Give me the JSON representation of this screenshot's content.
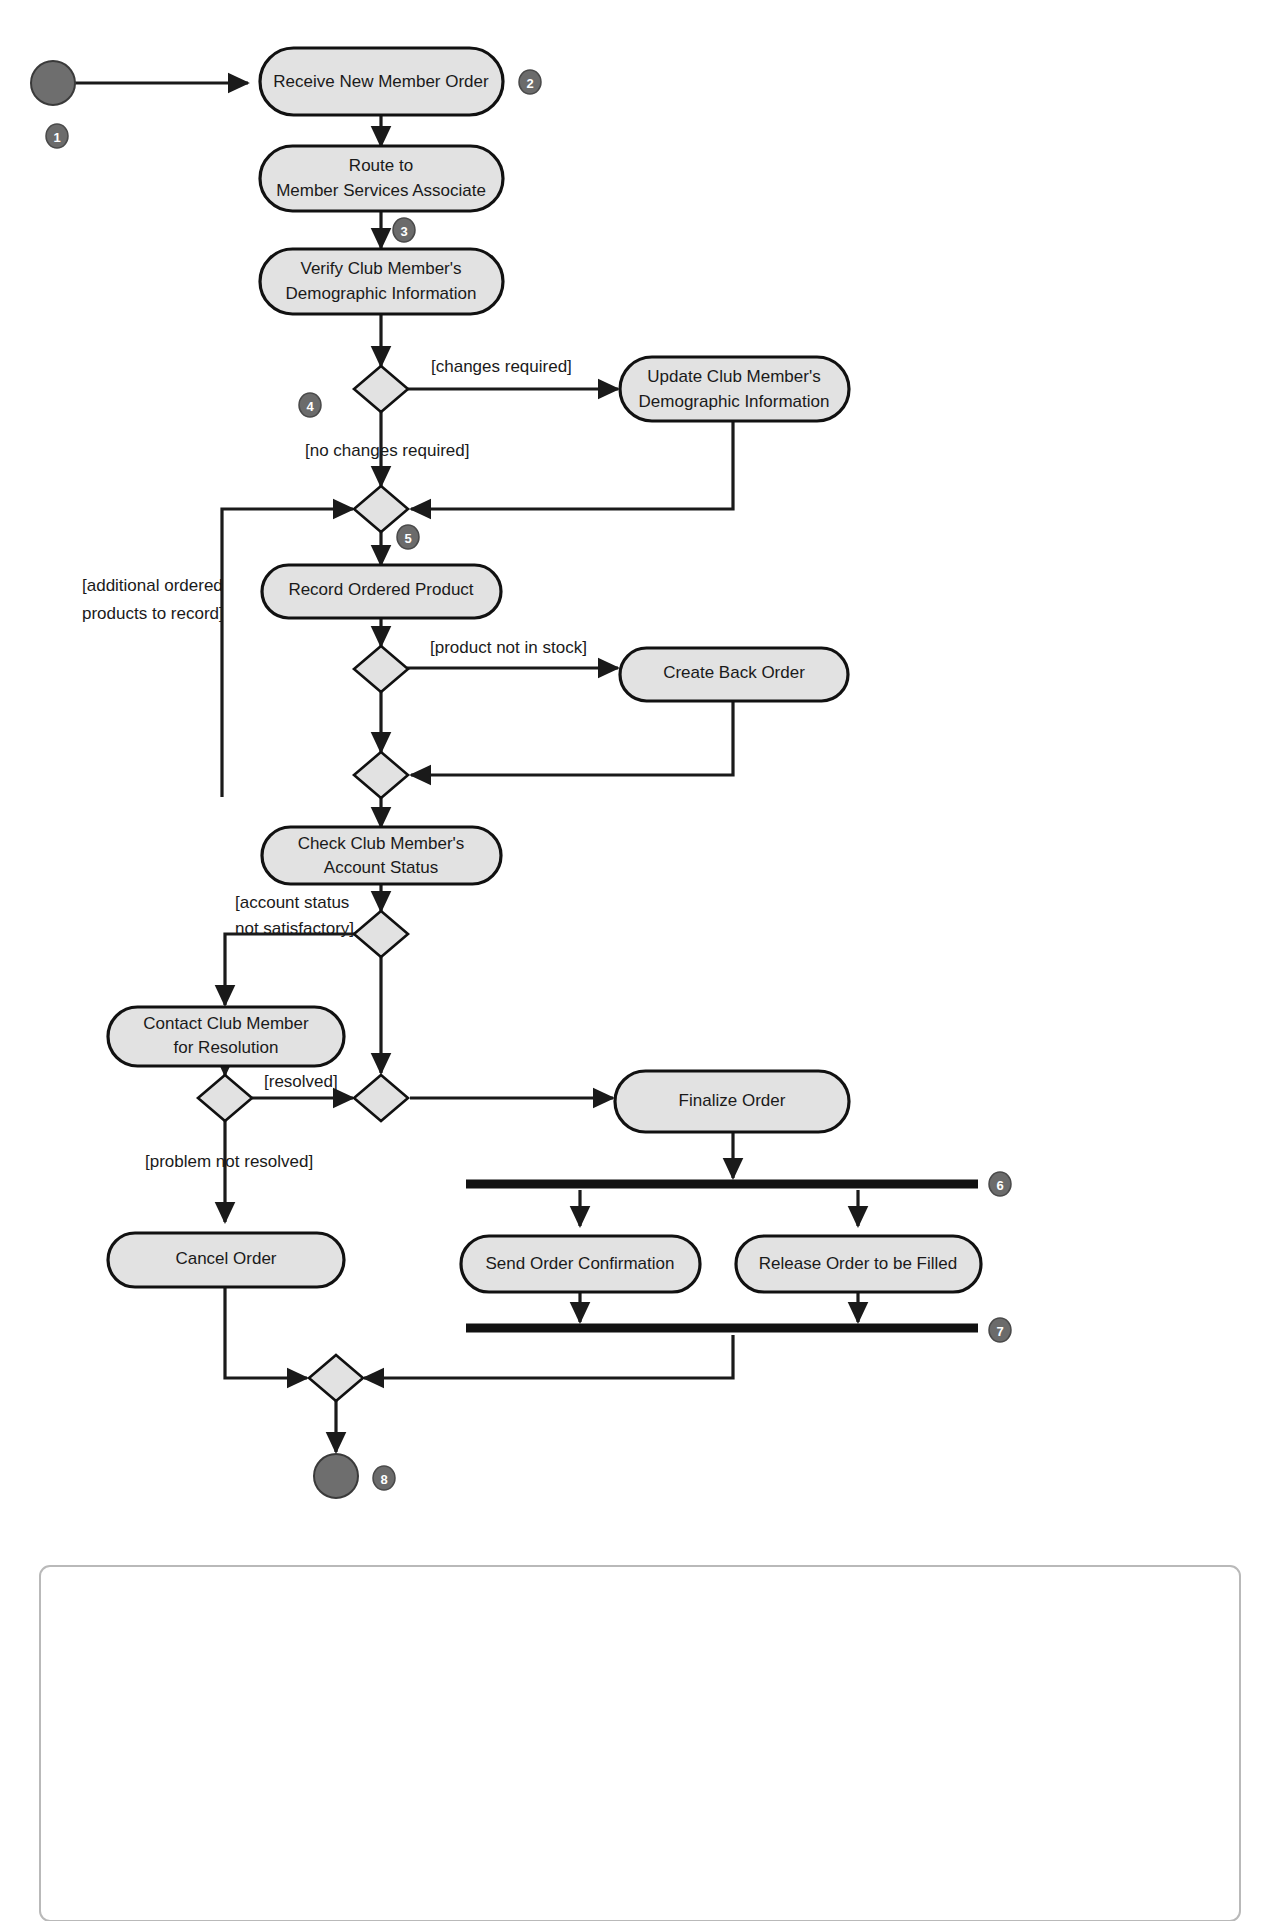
{
  "diagram": {
    "type": "uml-activity-diagram",
    "background_color": "#ffffff",
    "activity_fill": "#e2e2e2",
    "line_color": "#1a1a1a",
    "callout_fill": "#6b6b6b",
    "initial_node_fill": "#6e6e6e",
    "activities": [
      {
        "id": "receive",
        "label": "Receive New Member Order",
        "lines": [
          "Receive New Member Order"
        ]
      },
      {
        "id": "route",
        "label": "Route to Member Services Associate",
        "lines": [
          "Route to",
          "Member Services Associate"
        ]
      },
      {
        "id": "verify",
        "label": "Verify Club Member's Demographic Information",
        "lines": [
          "Verify Club Member's",
          "Demographic Information"
        ]
      },
      {
        "id": "update",
        "label": "Update Club Member's Demographic Information",
        "lines": [
          "Update Club Member's",
          "Demographic Information"
        ]
      },
      {
        "id": "record",
        "label": "Record Ordered Product",
        "lines": [
          "Record Ordered Product"
        ]
      },
      {
        "id": "backorder",
        "label": "Create Back Order",
        "lines": [
          "Create Back Order"
        ]
      },
      {
        "id": "checkacct",
        "label": "Check Club Member's Account Status",
        "lines": [
          "Check Club Member's",
          "Account Status"
        ]
      },
      {
        "id": "contact",
        "label": "Contact Club Member for Resolution",
        "lines": [
          "Contact Club Member",
          "for Resolution"
        ]
      },
      {
        "id": "cancel",
        "label": "Cancel Order",
        "lines": [
          "Cancel Order"
        ]
      },
      {
        "id": "finalize",
        "label": "Finalize Order",
        "lines": [
          "Finalize Order"
        ]
      },
      {
        "id": "sendconf",
        "label": "Send Order Confirmation",
        "lines": [
          "Send Order Confirmation"
        ]
      },
      {
        "id": "release",
        "label": "Release Order to be Filled",
        "lines": [
          "Release Order to be Filled"
        ]
      }
    ],
    "guards": [
      {
        "id": "changes_required",
        "lines": [
          "[changes required]"
        ]
      },
      {
        "id": "no_changes_required",
        "lines": [
          "[no changes required]"
        ]
      },
      {
        "id": "additional_products",
        "lines": [
          "[additional ordered",
          "products to record]"
        ]
      },
      {
        "id": "not_in_stock",
        "lines": [
          "[product not in stock]"
        ]
      },
      {
        "id": "acct_not_satisfactory",
        "lines": [
          "[account status",
          "not satisfactory]"
        ]
      },
      {
        "id": "resolved",
        "lines": [
          "[resolved]"
        ]
      },
      {
        "id": "not_resolved",
        "lines": [
          "[problem not resolved]"
        ]
      }
    ],
    "callouts": [
      {
        "id": "c1",
        "number": "1"
      },
      {
        "id": "c2",
        "number": "2"
      },
      {
        "id": "c3",
        "number": "3"
      },
      {
        "id": "c4",
        "number": "4"
      },
      {
        "id": "c5",
        "number": "5"
      },
      {
        "id": "c6",
        "number": "6"
      },
      {
        "id": "c7",
        "number": "7"
      },
      {
        "id": "c8",
        "number": "8"
      }
    ],
    "nodes": {
      "initial_label": "initial node",
      "final_label": "final node",
      "fork_label": "fork bar",
      "join_label": "join bar"
    }
  }
}
